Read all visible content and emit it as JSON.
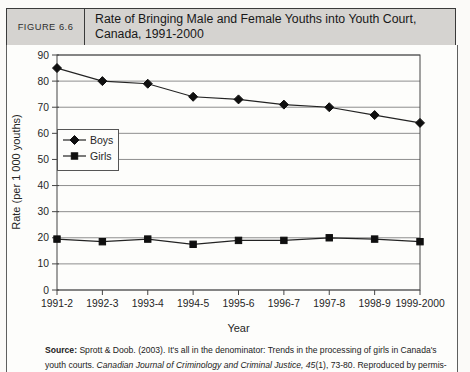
{
  "header": {
    "figure_label": "FIGURE 6.6",
    "title_line1": "Rate of Bringing Male and Female Youths into Youth Court,",
    "title_line2": "Canada, 1991-2000"
  },
  "chart_data": {
    "type": "line",
    "title": "Rate of Bringing Male and Female Youths into Youth Court, Canada, 1991-2000",
    "categories": [
      "1991-2",
      "1992-3",
      "1993-4",
      "1994-5",
      "1995-6",
      "1996-7",
      "1997-8",
      "1998-9",
      "1999-2000"
    ],
    "series": [
      {
        "name": "Boys",
        "marker": "diamond",
        "color": "#0f0f0f",
        "values": [
          85,
          80,
          79,
          74,
          73,
          71,
          70,
          67,
          64
        ]
      },
      {
        "name": "Girls",
        "marker": "square",
        "color": "#0f0f0f",
        "values": [
          19.5,
          18.5,
          19.5,
          17.5,
          19,
          19,
          20,
          19.5,
          18.5
        ]
      }
    ],
    "xlabel": "Year",
    "ylabel": "Rate (per 1 000 youths)",
    "ylim": [
      0,
      90
    ],
    "ytick_step": 10,
    "grid": true,
    "legend_position": "upper-left-inside"
  },
  "source": {
    "bold_label": "Source:",
    "line1_rest": " Sprott & Doob. (2003). It's all in the denominator: Trends in the processing of girls in Canada's",
    "line2_plain": "youth courts. ",
    "line2_italic": "Canadian Journal of Criminology and Criminal Justice, 45",
    "line2_tail": "(1), 73-80. Reproduced by permis-"
  }
}
